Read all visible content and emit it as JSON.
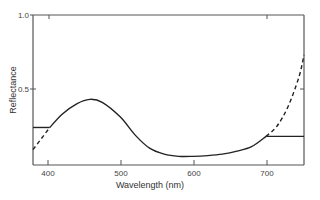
{
  "chart_data": {
    "type": "line",
    "title": "",
    "xlabel": "Wavelength (nm)",
    "ylabel": "Reflectance",
    "xlim": [
      380,
      752
    ],
    "ylim": [
      0,
      1.0
    ],
    "xticks": [
      400,
      500,
      600,
      700
    ],
    "xtick_labels": [
      "400",
      "500",
      "600",
      "700"
    ],
    "yticks": [
      0.5,
      1.0
    ],
    "ytick_labels": [
      "0.5",
      "1.0"
    ],
    "grid": false,
    "legend": null,
    "series": [
      {
        "name": "measured reflectance",
        "style": "solid",
        "x": [
          403,
          420,
          440,
          458,
          475,
          500,
          520,
          540,
          560,
          580,
          600,
          620,
          640,
          660,
          680,
          700
        ],
        "y": [
          0.24,
          0.33,
          0.4,
          0.43,
          0.41,
          0.31,
          0.19,
          0.1,
          0.06,
          0.045,
          0.045,
          0.05,
          0.06,
          0.08,
          0.11,
          0.18
        ]
      },
      {
        "name": "extrapolation constant (short wavelength)",
        "style": "solid",
        "x": [
          380,
          403
        ],
        "y": [
          0.24,
          0.24
        ]
      },
      {
        "name": "extrapolation constant (long wavelength)",
        "style": "solid",
        "x": [
          700,
          752
        ],
        "y": [
          0.18,
          0.18
        ]
      },
      {
        "name": "extrapolation trend (short wavelength)",
        "style": "dashed",
        "x": [
          380,
          403
        ],
        "y": [
          0.09,
          0.24
        ]
      },
      {
        "name": "extrapolation trend (long wavelength)",
        "style": "dashed",
        "x": [
          700,
          715,
          730,
          745,
          752
        ],
        "y": [
          0.18,
          0.25,
          0.38,
          0.58,
          0.73
        ]
      }
    ]
  },
  "axes": {
    "x_title": "Wavelength (nm)",
    "y_title": "Reflectance",
    "y_tick_top": "1.0",
    "y_tick_mid": "0.5",
    "x_tick_400": "400",
    "x_tick_500": "500",
    "x_tick_600": "600",
    "x_tick_700": "700"
  }
}
